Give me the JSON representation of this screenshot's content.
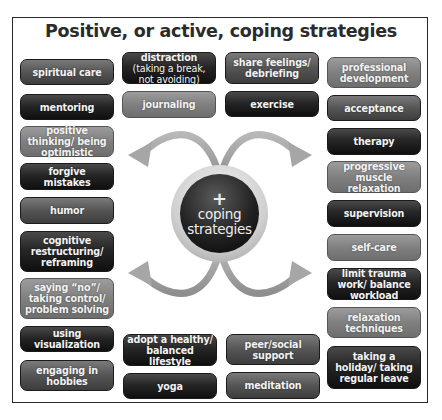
{
  "title": "Positive, or active, coping strategies",
  "center": {
    "symbol": "+",
    "label_line1": "coping",
    "label_line2": "strategies"
  },
  "strategies": {
    "left": [
      {
        "label": "spiritual care",
        "shade": "mid"
      },
      {
        "label": "mentoring",
        "shade": "dark"
      },
      {
        "label": "positive thinking/ being optimistic",
        "shade": "light"
      },
      {
        "label": "forgive mistakes",
        "shade": "dark"
      },
      {
        "label": "humor",
        "shade": "mid"
      },
      {
        "label": "cognitive restructuring/ reframing",
        "shade": "dark"
      },
      {
        "label": "saying “no”/ taking control/ problem solving",
        "shade": "light"
      },
      {
        "label": "using visualization",
        "shade": "dark"
      },
      {
        "label": "engaging in hobbies",
        "shade": "mid"
      }
    ],
    "top_middle": [
      {
        "label_bold": "distraction",
        "label_rest": " (taking a break, not avoiding)",
        "shade": "dark"
      },
      {
        "label": "journaling",
        "shade": "light"
      },
      {
        "label": "share feelings/ debriefing",
        "shade": "mid"
      },
      {
        "label": "exercise",
        "shade": "dark"
      }
    ],
    "bottom_middle": [
      {
        "label": "adopt a healthy/ balanced lifestyle",
        "shade": "dark"
      },
      {
        "label": "yoga",
        "shade": "dark"
      },
      {
        "label": "peer/social support",
        "shade": "mid"
      },
      {
        "label": "meditation",
        "shade": "mid"
      }
    ],
    "right": [
      {
        "label": "professional development",
        "shade": "light"
      },
      {
        "label": "acceptance",
        "shade": "mid"
      },
      {
        "label": "therapy",
        "shade": "dark"
      },
      {
        "label": "progressive muscle relaxation",
        "shade": "light"
      },
      {
        "label": "supervision",
        "shade": "dark"
      },
      {
        "label": "self-care",
        "shade": "light"
      },
      {
        "label": "limit trauma work/ balance workload",
        "shade": "dark"
      },
      {
        "label": "relaxation techniques",
        "shade": "light"
      },
      {
        "label": "taking a holiday/ taking regular leave",
        "shade": "dark"
      }
    ]
  },
  "colors": {
    "dark_box": "#1e1e1e",
    "mid_box": "#555555",
    "light_box": "#828282",
    "arrow": "#a9a9a9",
    "frame": "#2a2a2a"
  }
}
